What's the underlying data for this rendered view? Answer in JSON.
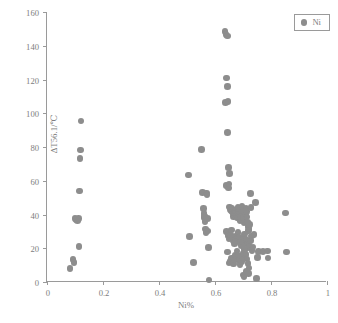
{
  "chart_data": {
    "type": "scatter",
    "title": "",
    "xlabel": "Ni%",
    "ylabel": "ΔT56.1/℃",
    "xlim": [
      0,
      1
    ],
    "ylim": [
      0,
      160
    ],
    "xticks": [
      0,
      0.2,
      0.4,
      0.6,
      0.8,
      1
    ],
    "xtick_labels": [
      "0",
      "0.2",
      "0.4",
      "0.6",
      "0.8",
      "1"
    ],
    "yticks": [
      0,
      20,
      40,
      60,
      80,
      100,
      120,
      140,
      160
    ],
    "ytick_labels": [
      "0",
      "20",
      "40",
      "60",
      "80",
      "100",
      "120",
      "140",
      "160"
    ],
    "grid": false,
    "legend": {
      "position": "top-right",
      "entries": [
        {
          "name": "Ni",
          "marker": "circle",
          "color": "#8d8d8d"
        }
      ]
    },
    "marker_color": "#8d8d8d",
    "marker_size": 6.6,
    "series": [
      {
        "name": "Ni",
        "color": "#8d8d8d",
        "points": [
          [
            0.082,
            8.0
          ],
          [
            0.093,
            13.5
          ],
          [
            0.096,
            11.5
          ],
          [
            0.1,
            37.5
          ],
          [
            0.104,
            37.0
          ],
          [
            0.108,
            36.3
          ],
          [
            0.112,
            37.6
          ],
          [
            0.114,
            21.2
          ],
          [
            0.116,
            54.0
          ],
          [
            0.118,
            73.2
          ],
          [
            0.119,
            78.3
          ],
          [
            0.121,
            95.5
          ],
          [
            0.505,
            63.3
          ],
          [
            0.508,
            27.0
          ],
          [
            0.524,
            11.4
          ],
          [
            0.552,
            78.6
          ],
          [
            0.556,
            53.2
          ],
          [
            0.558,
            43.5
          ],
          [
            0.56,
            40.5
          ],
          [
            0.562,
            38.2
          ],
          [
            0.563,
            38.8
          ],
          [
            0.565,
            36.0
          ],
          [
            0.566,
            31.5
          ],
          [
            0.568,
            29.3
          ],
          [
            0.57,
            52.8
          ],
          [
            0.571,
            51.5
          ],
          [
            0.573,
            37.7
          ],
          [
            0.575,
            30.2
          ],
          [
            0.577,
            20.4
          ],
          [
            0.579,
            1.2
          ],
          [
            0.636,
            148.5
          ],
          [
            0.64,
            146.8
          ],
          [
            0.645,
            145.8
          ],
          [
            0.642,
            121.0
          ],
          [
            0.644,
            115.8
          ],
          [
            0.638,
            106.5
          ],
          [
            0.646,
            106.8
          ],
          [
            0.645,
            88.7
          ],
          [
            0.648,
            67.8
          ],
          [
            0.652,
            64.3
          ],
          [
            0.64,
            57.2
          ],
          [
            0.648,
            55.8
          ],
          [
            0.65,
            58.0
          ],
          [
            0.652,
            44.5
          ],
          [
            0.655,
            42.8
          ],
          [
            0.658,
            42.0
          ],
          [
            0.66,
            43.6
          ],
          [
            0.662,
            41.5
          ],
          [
            0.664,
            40.2
          ],
          [
            0.666,
            38.8
          ],
          [
            0.668,
            39.7
          ],
          [
            0.67,
            41.0
          ],
          [
            0.672,
            42.5
          ],
          [
            0.674,
            40.8
          ],
          [
            0.676,
            39.2
          ],
          [
            0.678,
            38.0
          ],
          [
            0.68,
            43.0
          ],
          [
            0.682,
            44.2
          ],
          [
            0.684,
            41.6
          ],
          [
            0.686,
            40.0
          ],
          [
            0.688,
            37.5
          ],
          [
            0.69,
            36.4
          ],
          [
            0.692,
            38.6
          ],
          [
            0.694,
            42.4
          ],
          [
            0.696,
            44.8
          ],
          [
            0.698,
            41.2
          ],
          [
            0.7,
            39.0
          ],
          [
            0.702,
            36.8
          ],
          [
            0.704,
            35.2
          ],
          [
            0.706,
            37.1
          ],
          [
            0.708,
            40.6
          ],
          [
            0.71,
            43.9
          ],
          [
            0.712,
            41.8
          ],
          [
            0.714,
            38.4
          ],
          [
            0.716,
            35.6
          ],
          [
            0.718,
            33.0
          ],
          [
            0.72,
            30.5
          ],
          [
            0.722,
            31.8
          ],
          [
            0.724,
            34.2
          ],
          [
            0.642,
            30.0
          ],
          [
            0.646,
            27.4
          ],
          [
            0.65,
            25.6
          ],
          [
            0.654,
            28.2
          ],
          [
            0.658,
            30.8
          ],
          [
            0.662,
            27.0
          ],
          [
            0.666,
            24.5
          ],
          [
            0.67,
            22.8
          ],
          [
            0.674,
            25.0
          ],
          [
            0.678,
            27.6
          ],
          [
            0.682,
            29.4
          ],
          [
            0.686,
            26.2
          ],
          [
            0.69,
            23.5
          ],
          [
            0.694,
            21.6
          ],
          [
            0.698,
            24.0
          ],
          [
            0.702,
            26.6
          ],
          [
            0.706,
            28.4
          ],
          [
            0.71,
            25.2
          ],
          [
            0.714,
            22.4
          ],
          [
            0.718,
            20.2
          ],
          [
            0.722,
            22.0
          ],
          [
            0.726,
            24.6
          ],
          [
            0.73,
            27.2
          ],
          [
            0.644,
            17.8
          ],
          [
            0.65,
            11.2
          ],
          [
            0.654,
            12.4
          ],
          [
            0.658,
            14.0
          ],
          [
            0.662,
            11.8
          ],
          [
            0.666,
            10.6
          ],
          [
            0.67,
            13.2
          ],
          [
            0.674,
            16.0
          ],
          [
            0.678,
            18.4
          ],
          [
            0.682,
            15.6
          ],
          [
            0.686,
            12.8
          ],
          [
            0.69,
            10.4
          ],
          [
            0.694,
            12.0
          ],
          [
            0.698,
            14.6
          ],
          [
            0.702,
            17.0
          ],
          [
            0.706,
            19.2
          ],
          [
            0.71,
            16.4
          ],
          [
            0.714,
            13.6
          ],
          [
            0.718,
            11.0
          ],
          [
            0.722,
            8.4
          ],
          [
            0.7,
            4.2
          ],
          [
            0.704,
            3.3
          ],
          [
            0.712,
            6.2
          ],
          [
            0.72,
            5.0
          ],
          [
            0.732,
            18.6
          ],
          [
            0.736,
            20.8
          ],
          [
            0.74,
            28.2
          ],
          [
            0.744,
            47.2
          ],
          [
            0.728,
            44.2
          ],
          [
            0.726,
            52.6
          ],
          [
            0.748,
            2.2
          ],
          [
            0.752,
            14.5
          ],
          [
            0.755,
            18.2
          ],
          [
            0.772,
            18.0
          ],
          [
            0.788,
            18.4
          ],
          [
            0.79,
            14.3
          ],
          [
            0.852,
            41.0
          ],
          [
            0.856,
            17.8
          ]
        ]
      }
    ]
  },
  "axes": {
    "x_label_text": "Ni%",
    "y_label_text": "ΔT56.1/℃"
  },
  "legend": {
    "entry_label": "Ni"
  }
}
